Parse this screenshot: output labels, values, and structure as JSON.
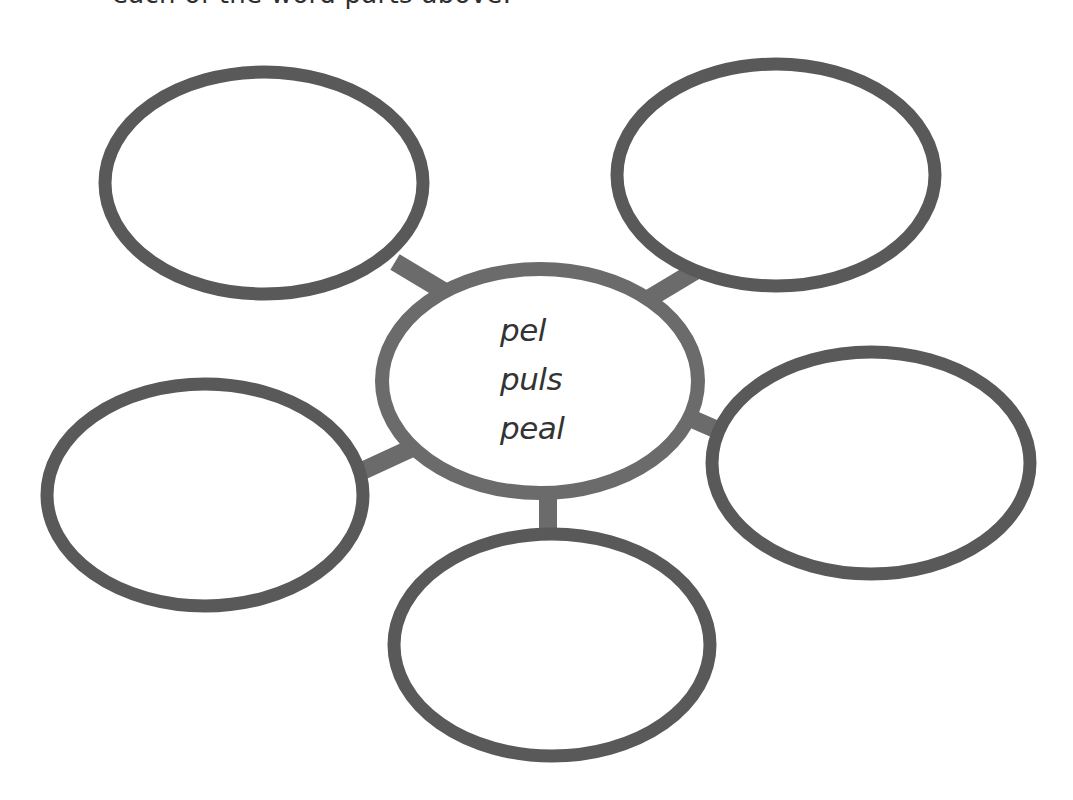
{
  "instruction": {
    "clipped_text": "each of the word parts above."
  },
  "diagram": {
    "type": "word-web",
    "center": {
      "words": [
        "pel",
        "puls",
        "peal"
      ]
    },
    "outer_nodes": [
      {
        "id": "top-left",
        "text": ""
      },
      {
        "id": "top-right",
        "text": ""
      },
      {
        "id": "right",
        "text": ""
      },
      {
        "id": "bottom",
        "text": ""
      },
      {
        "id": "left",
        "text": ""
      }
    ],
    "colors": {
      "node_stroke": "#595959",
      "center_stroke": "#6b6b6b",
      "connector": "#6b6b6b",
      "fill": "#ffffff",
      "text": "#333333"
    }
  }
}
